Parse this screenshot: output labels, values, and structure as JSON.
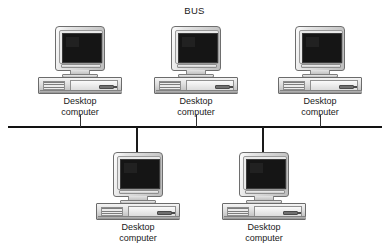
{
  "diagram": {
    "title": "BUS",
    "type": "bus-network-topology",
    "backbone": {
      "name": "bus-backbone-line",
      "orientation": "horizontal",
      "y": 127,
      "x_start": 8,
      "x_end": 382,
      "color": "#121212"
    },
    "label_line1": "Desktop",
    "label_line2": "computer",
    "nodes": [
      {
        "id": "node-top-left",
        "label_line1": "Desktop",
        "label_line2": "computer",
        "x": 38,
        "y": 26,
        "attach": "above",
        "drop_x": 80,
        "drop_top": 115,
        "drop_height": 12
      },
      {
        "id": "node-top-center",
        "label_line1": "Desktop",
        "label_line2": "computer",
        "x": 154,
        "y": 26,
        "attach": "above",
        "drop_x": 196,
        "drop_top": 115,
        "drop_height": 12
      },
      {
        "id": "node-top-right",
        "label_line1": "Desktop",
        "label_line2": "computer",
        "x": 278,
        "y": 26,
        "attach": "above",
        "drop_x": 320,
        "drop_top": 115,
        "drop_height": 12
      },
      {
        "id": "node-bottom-left",
        "label_line1": "Desktop",
        "label_line2": "computer",
        "x": 96,
        "y": 152,
        "attach": "below",
        "drop_x": 137,
        "drop_top": 127,
        "drop_height": 26
      },
      {
        "id": "node-bottom-right",
        "label_line1": "Desktop",
        "label_line2": "computer",
        "x": 222,
        "y": 152,
        "attach": "below",
        "drop_x": 263,
        "drop_top": 127,
        "drop_height": 26
      }
    ],
    "colors": {
      "background": "#ffffff",
      "line": "#121212",
      "text": "#1a1a1a",
      "screen": "#151515",
      "chassis_light": "#f4f4f4",
      "chassis_dark": "#ababab"
    }
  }
}
